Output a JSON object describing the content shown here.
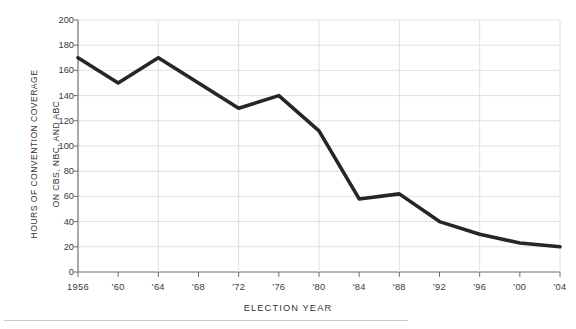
{
  "chart_data": {
    "type": "line",
    "title": "",
    "xlabel": "ELECTION  YEAR",
    "ylabel": "HOURS OF CONVENTION COVERAGE\nON CBS, NBC, AND ABC",
    "ylabel_line1": "HOURS OF CONVENTION COVERAGE",
    "ylabel_line2": "ON CBS, NBC, AND ABC",
    "categories": [
      "1956",
      "'60",
      "'64",
      "'68",
      "'72",
      "'76",
      "'80",
      "'84",
      "'88",
      "'92",
      "'96",
      "'00",
      "'04"
    ],
    "x": [
      1956,
      1960,
      1964,
      1968,
      1972,
      1976,
      1980,
      1984,
      1988,
      1992,
      1996,
      2000,
      2004
    ],
    "values": [
      170,
      150,
      170,
      150,
      130,
      140,
      112,
      58,
      62,
      40,
      30,
      23,
      20
    ],
    "series": [
      {
        "name": "Hours of convention coverage on CBS, NBC, and ABC",
        "values": [
          170,
          150,
          170,
          150,
          130,
          140,
          112,
          58,
          62,
          40,
          30,
          23,
          20
        ]
      }
    ],
    "ylim": [
      0,
      200
    ],
    "ytick_values": [
      0,
      20,
      40,
      60,
      80,
      100,
      120,
      140,
      160,
      180,
      200
    ],
    "ytick_labels": [
      "0",
      "20",
      "40",
      "60",
      "80",
      "100",
      "120",
      "140",
      "160",
      "180",
      "200"
    ],
    "xlim": [
      1956,
      2004
    ],
    "grid": "both-light",
    "legend": "none",
    "line_color": "#262626",
    "grid_color": "#dcdcdc",
    "axis_color": "#9a9a9a",
    "text_color": "#333333",
    "background": "#ffffff",
    "line_width": 3.6
  },
  "footer": {
    "rule": ""
  }
}
